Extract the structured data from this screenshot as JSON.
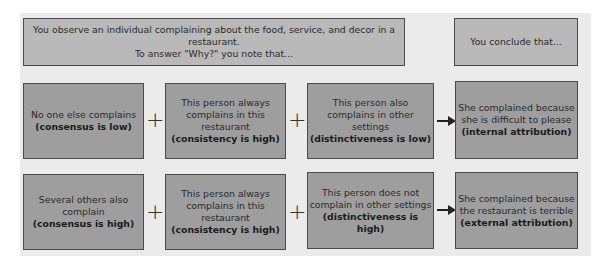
{
  "header": {
    "observation_line1": "You observe an individual complaining about the  food, service, and decor in a restaurant.",
    "observation_line2": "To answer \"Why?\" you note that...",
    "conclusion": "You conclude that..."
  },
  "rows": [
    {
      "consensus": {
        "text": "No one else  complains",
        "bold": "(consensus is low)"
      },
      "consistency": {
        "text1": "This person always",
        "text2": "complains in this",
        "text3": "restaurant",
        "bold": "(consistency is high)"
      },
      "distinctiveness": {
        "text1": "This person also",
        "text2": "complains in other settings",
        "bold": "(distinctiveness is low)"
      },
      "conclusion": {
        "text1": "She complained because",
        "text2": "she is difficult to please",
        "bold": "(internal attribution)"
      }
    },
    {
      "consensus": {
        "text1": "Several others also",
        "text2": "complain",
        "bold": "(consensus is high)"
      },
      "consistency": {
        "text1": "This person always",
        "text2": "complains in this",
        "text3": "restaurant",
        "bold": "(consistency is high)"
      },
      "distinctiveness": {
        "text1": "This person does not",
        "text2": "complain in other settings",
        "bold": "(distinctiveness is  high)"
      },
      "conclusion": {
        "text1": "She complained because",
        "text2": "the restaurant is terrible",
        "bold": "(external attribution)"
      }
    }
  ],
  "symbols": {
    "plus": "+"
  },
  "colors": {
    "panel": "#ebebeb",
    "header_box": "#b9b9b9",
    "box": "#9e9e9e",
    "border": "#4a4a4a"
  }
}
